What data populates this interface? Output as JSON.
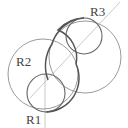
{
  "diagram": {
    "labels": {
      "r1": "R1",
      "r2": "R2",
      "r3": "R3"
    },
    "colors": {
      "thin": "#9a9a9a",
      "bold": "#555555",
      "guide": "#bbbbbb",
      "text": "#444444"
    }
  }
}
